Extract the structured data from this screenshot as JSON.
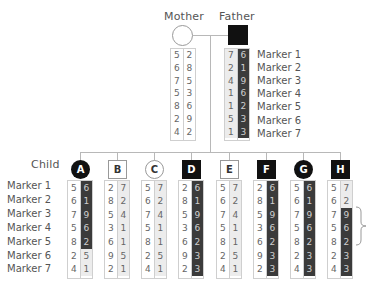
{
  "parents": {
    "mother": {
      "label": "Mother",
      "symbol": "circle",
      "affected": false,
      "alleles": [
        {
          "a": "5",
          "b": "2"
        },
        {
          "a": "6",
          "b": "8"
        },
        {
          "a": "7",
          "b": "5"
        },
        {
          "a": "5",
          "b": "3"
        },
        {
          "a": "8",
          "b": "6"
        },
        {
          "a": "2",
          "b": "9"
        },
        {
          "a": "4",
          "b": "2"
        }
      ],
      "shading": [
        "white",
        "white",
        "white",
        "white",
        "white",
        "white",
        "white"
      ]
    },
    "father": {
      "label": "Father",
      "symbol": "square",
      "affected": true,
      "alleles": [
        {
          "a": "7",
          "b": "6"
        },
        {
          "a": "2",
          "b": "1"
        },
        {
          "a": "4",
          "b": "9"
        },
        {
          "a": "1",
          "b": "6"
        },
        {
          "a": "1",
          "b": "2"
        },
        {
          "a": "5",
          "b": "3"
        },
        {
          "a": "1",
          "b": "3"
        }
      ],
      "shading": [
        "dark",
        "dark",
        "dark",
        "dark",
        "dark",
        "dark",
        "dark"
      ]
    }
  },
  "markers": [
    "Marker 1",
    "Marker 2",
    "Marker 3",
    "Marker 4",
    "Marker 5",
    "Marker 6",
    "Marker 7"
  ],
  "child_row_label": "Child",
  "children": [
    {
      "id": "A",
      "symbol": "circle",
      "affected": true,
      "left": [
        "5",
        "6",
        "7",
        "5",
        "8",
        "2",
        "4"
      ],
      "right": [
        "6",
        "1",
        "9",
        "6",
        "2",
        "5",
        "1"
      ],
      "shading": [
        "dark",
        "dark",
        "dark",
        "dark",
        "dark",
        "light",
        "light"
      ]
    },
    {
      "id": "B",
      "symbol": "square",
      "affected": false,
      "left": [
        "2",
        "8",
        "5",
        "3",
        "6",
        "9",
        "2"
      ],
      "right": [
        "7",
        "2",
        "4",
        "1",
        "1",
        "5",
        "1"
      ],
      "shading": [
        "light",
        "light",
        "light",
        "light",
        "light",
        "light",
        "light"
      ]
    },
    {
      "id": "C",
      "symbol": "circle",
      "affected": false,
      "left": [
        "5",
        "6",
        "7",
        "5",
        "8",
        "2",
        "4"
      ],
      "right": [
        "7",
        "2",
        "4",
        "1",
        "1",
        "5",
        "1"
      ],
      "shading": [
        "light",
        "light",
        "light",
        "light",
        "light",
        "light",
        "light"
      ]
    },
    {
      "id": "D",
      "symbol": "square",
      "affected": true,
      "left": [
        "2",
        "8",
        "5",
        "3",
        "6",
        "9",
        "2"
      ],
      "right": [
        "6",
        "1",
        "9",
        "6",
        "2",
        "3",
        "3"
      ],
      "shading": [
        "dark",
        "dark",
        "dark",
        "dark",
        "dark",
        "dark",
        "dark"
      ]
    },
    {
      "id": "E",
      "symbol": "square",
      "affected": false,
      "left": [
        "5",
        "6",
        "7",
        "5",
        "8",
        "2",
        "4"
      ],
      "right": [
        "7",
        "2",
        "4",
        "1",
        "1",
        "5",
        "1"
      ],
      "shading": [
        "light",
        "light",
        "light",
        "light",
        "light",
        "light",
        "light"
      ]
    },
    {
      "id": "F",
      "symbol": "square",
      "affected": true,
      "left": [
        "2",
        "8",
        "5",
        "3",
        "6",
        "9",
        "2"
      ],
      "right": [
        "6",
        "1",
        "9",
        "6",
        "2",
        "3",
        "3"
      ],
      "shading": [
        "dark",
        "dark",
        "dark",
        "dark",
        "dark",
        "dark",
        "dark"
      ]
    },
    {
      "id": "G",
      "symbol": "circle",
      "affected": true,
      "left": [
        "5",
        "6",
        "7",
        "5",
        "8",
        "2",
        "4"
      ],
      "right": [
        "6",
        "1",
        "9",
        "6",
        "2",
        "3",
        "3"
      ],
      "shading": [
        "dark",
        "dark",
        "dark",
        "dark",
        "dark",
        "dark",
        "dark"
      ]
    },
    {
      "id": "H",
      "symbol": "square",
      "affected": true,
      "left": [
        "5",
        "6",
        "7",
        "5",
        "8",
        "2",
        "4"
      ],
      "right": [
        "7",
        "2",
        "9",
        "6",
        "2",
        "3",
        "3"
      ],
      "shading": [
        "light",
        "light",
        "dark",
        "dark",
        "dark",
        "dark",
        "dark"
      ]
    }
  ],
  "bracket": {
    "from_marker": 3,
    "to_marker": 5,
    "child": "H"
  },
  "colors": {
    "affected": "#111111",
    "dark_allele": "#3b3b3b",
    "light_allele": "#ececec",
    "line": "#b8b8b8"
  }
}
